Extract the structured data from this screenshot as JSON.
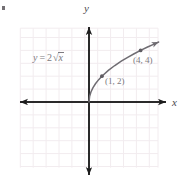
{
  "figure": {
    "kind": "coordinate-plane-graph",
    "background_color": "#ffffff",
    "corner_mark": "",
    "axis": {
      "x_label": "x",
      "y_label": "y",
      "axis_color": "#1c1c1c",
      "origin_px": [
        89,
        102
      ],
      "unit_px": 12.9,
      "x_axis_arrow_left_px": 11,
      "x_axis_arrow_right_px": 170,
      "y_axis_arrow_top_px": 21,
      "y_axis_arrow_bottom_px": 182
    },
    "grid": {
      "show": true,
      "color": "#f3eef0",
      "left_px": 20,
      "top_px": 28,
      "right_px": 158,
      "bottom_px": 168,
      "spacing_px": 12.9
    }
  },
  "labels": {
    "equation_y": "y",
    "equation_eq": "=",
    "equation_coefficient": "2",
    "equation_radical": "√",
    "equation_radicand": "x",
    "point_1": "(1, 2)",
    "point_2": "(4, 4)"
  },
  "chart_data": {
    "type": "line",
    "title": "",
    "subtitle": "",
    "xlabel": "x",
    "ylabel": "y",
    "equation": "y = 2√x",
    "curve_color": "#6f6c72",
    "grid": true,
    "legend_position": "none",
    "xlim": [
      -5.3,
      5.4
    ],
    "ylim": [
      -5.1,
      5.7
    ],
    "x_ticks": [
      -5,
      -4,
      -3,
      -2,
      -1,
      0,
      1,
      2,
      3,
      4,
      5
    ],
    "y_ticks": [
      -5,
      -4,
      -3,
      -2,
      -1,
      0,
      1,
      2,
      3,
      4,
      5
    ],
    "x_tick_labels": [],
    "y_tick_labels": [],
    "series": [
      {
        "name": "y = 2√x",
        "x": [
          0,
          0.05,
          0.15,
          0.3,
          0.5,
          0.75,
          1.0,
          1.5,
          2.0,
          2.5,
          3.0,
          3.5,
          4.0,
          4.5,
          5.0,
          5.4
        ],
        "values": [
          0,
          0.447,
          0.775,
          1.095,
          1.414,
          1.732,
          2.0,
          2.449,
          2.828,
          3.162,
          3.464,
          3.742,
          4.0,
          4.243,
          4.472,
          4.648
        ],
        "arrow_end": true
      }
    ],
    "annotations": [
      {
        "label": "(1, 2)",
        "x": 1,
        "y": 2,
        "marker": true,
        "label_offset_px": [
          8,
          0
        ]
      },
      {
        "label": "(4, 4)",
        "x": 4,
        "y": 4,
        "marker": true,
        "label_offset_px": [
          4,
          10
        ]
      },
      {
        "label": "y = 2√x",
        "x": -4.0,
        "y": 3.3,
        "marker": false,
        "label_offset_px": [
          0,
          0
        ]
      }
    ]
  }
}
